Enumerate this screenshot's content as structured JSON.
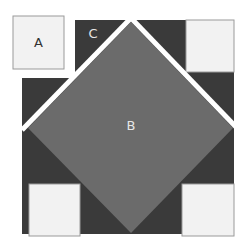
{
  "diagram": {
    "labels": {
      "a": "A",
      "b": "B",
      "c": "C"
    },
    "colors": {
      "background": "#ffffff",
      "light_square": "#f2f2f2",
      "light_square_border": "#9a9a9a",
      "dark_triangle": "#3a3a3a",
      "diamond": "#6b6b6b",
      "separator": "#ffffff",
      "label_dark": "#333333",
      "label_light": "#e6e6e6"
    }
  }
}
